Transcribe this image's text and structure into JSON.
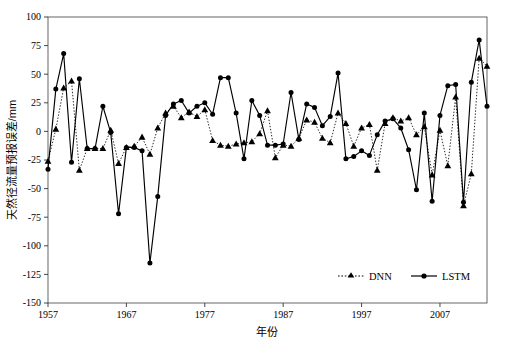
{
  "chart_data": {
    "type": "line",
    "title": "",
    "xlabel": "年份",
    "ylabel": "天然径流量预报误差/mm",
    "xlim": [
      1957,
      2013
    ],
    "ylim": [
      -150,
      100
    ],
    "ytick_step": 25,
    "xticks": [
      1957,
      1967,
      1977,
      1987,
      1997,
      2007
    ],
    "yticks": [
      100,
      75,
      50,
      25,
      0,
      -25,
      -50,
      -75,
      -100,
      -125,
      -150
    ],
    "grid": false,
    "legend_position": "bottom-right",
    "x": [
      1957,
      1958,
      1959,
      1960,
      1961,
      1962,
      1963,
      1964,
      1965,
      1966,
      1967,
      1968,
      1969,
      1970,
      1971,
      1972,
      1973,
      1974,
      1975,
      1976,
      1977,
      1978,
      1979,
      1980,
      1981,
      1982,
      1983,
      1984,
      1985,
      1986,
      1987,
      1988,
      1989,
      1990,
      1991,
      1992,
      1993,
      1994,
      1995,
      1996,
      1997,
      1998,
      1999,
      2000,
      2001,
      2002,
      2003,
      2004,
      2005,
      2006,
      2007,
      2008,
      2009,
      2010,
      2011,
      2012,
      2013
    ],
    "series": [
      {
        "name": "DNN",
        "marker": "triangle",
        "linestyle": "dotted",
        "color": "#000000",
        "values": [
          -26,
          2,
          38,
          44,
          -34,
          -15,
          -15,
          -15,
          1,
          -28,
          -14,
          -13,
          -5,
          -20,
          3,
          16,
          22,
          12,
          17,
          13,
          19,
          -8,
          -12,
          -13,
          -11,
          -10,
          -9,
          -2,
          18,
          -23,
          -12,
          -13,
          -6,
          10,
          8,
          -6,
          -10,
          16,
          7,
          -13,
          3,
          6,
          -34,
          7,
          12,
          9,
          12,
          -3,
          4,
          -38,
          1,
          -30,
          30,
          -65,
          -37,
          64,
          57
        ]
      },
      {
        "name": "LSTM",
        "marker": "circle",
        "linestyle": "solid",
        "color": "#000000",
        "values": [
          -33,
          37,
          68,
          -27,
          46,
          -15,
          -15,
          22,
          -1,
          -72,
          -14,
          -14,
          -17,
          -115,
          -57,
          14,
          24,
          27,
          16,
          22,
          25,
          15,
          47,
          47,
          16,
          -24,
          27,
          14,
          -12,
          -12,
          -11,
          34,
          -7,
          24,
          21,
          5,
          13,
          51,
          -24,
          -22,
          -17,
          -21,
          -3,
          9,
          11,
          3,
          -16,
          -51,
          16,
          -61,
          14,
          40,
          41,
          -62,
          43,
          80,
          22
        ]
      }
    ]
  },
  "legend": {
    "items": [
      {
        "label": "DNN",
        "marker": "triangle",
        "style": "dotted"
      },
      {
        "label": "LSTM",
        "marker": "circle",
        "style": "solid"
      }
    ]
  },
  "axes": {
    "y_title": "天然径流量预报误差/mm",
    "x_title": "年份",
    "y_tick_labels": [
      "100",
      "75",
      "50",
      "25",
      "0",
      "-25",
      "-50",
      "-75",
      "-100",
      "-125",
      "-150"
    ],
    "x_tick_labels": [
      "1957",
      "1967",
      "1977",
      "1987",
      "1997",
      "2007"
    ]
  }
}
